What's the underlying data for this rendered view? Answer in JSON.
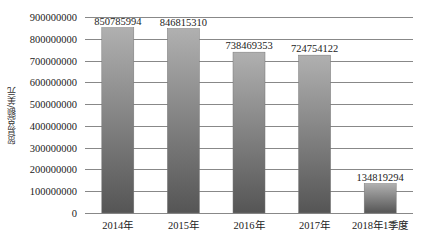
{
  "chart_data": {
    "type": "bar",
    "title": "",
    "xlabel": "",
    "ylabel": "贸易总额/美元",
    "categories": [
      "2014年",
      "2015年",
      "2016年",
      "2017年",
      "2018年1季度"
    ],
    "values": [
      850785994,
      846815310,
      738469353,
      724754122,
      134819294
    ],
    "data_labels": [
      "850785994",
      "846815310",
      "738469353",
      "724754122",
      "134819294"
    ],
    "ylim": [
      0,
      900000000
    ],
    "yticks": [
      0,
      100000000,
      200000000,
      300000000,
      400000000,
      500000000,
      600000000,
      700000000,
      800000000,
      900000000
    ],
    "ytick_labels": [
      "0",
      "100000000",
      "200000000",
      "300000000",
      "400000000",
      "500000000",
      "600000000",
      "700000000",
      "800000000",
      "900000000"
    ],
    "grid": true,
    "legend": null,
    "colors": {
      "bar_top": "#b0b0b0",
      "bar_bottom": "#555555",
      "grid": "#888888",
      "text": "#222222"
    }
  }
}
